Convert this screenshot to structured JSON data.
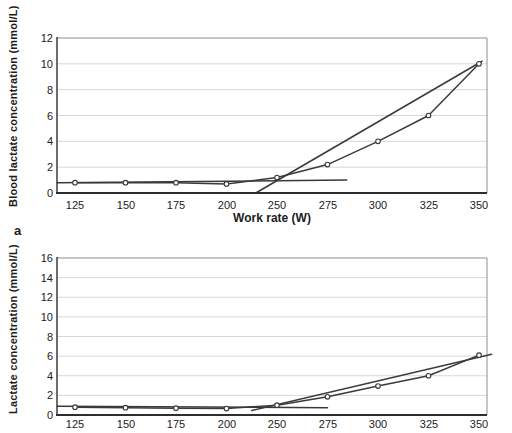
{
  "figure": {
    "panel_label": "a"
  },
  "colors": {
    "line": "#3a3a3a",
    "grid": "#d6d6d6",
    "border": "#8f8f8f",
    "axis": "#2e2e2e",
    "text": "#1c1c1c",
    "marker_fill": "#ffffff",
    "background": "#ffffff"
  },
  "chart_data": [
    {
      "type": "line",
      "title": "",
      "xlabel": "Work rate (W)",
      "ylabel": "Blood lactate concentration (mmol/L)",
      "categories": [
        "125",
        "150",
        "175",
        "200",
        "250",
        "275",
        "300",
        "325",
        "350"
      ],
      "ylim": [
        0,
        12
      ],
      "yticks": [
        0,
        2,
        4,
        6,
        8,
        10,
        12
      ],
      "grid": true,
      "legend": "none",
      "series": [
        {
          "name": "blood lactate",
          "marker": "open-circle",
          "values": [
            0.8,
            0.8,
            0.8,
            0.7,
            1.2,
            2.2,
            4.0,
            6.0,
            10.0
          ]
        }
      ],
      "fit_lines": [
        {
          "name": "baseline-fit-line",
          "x1": -0.35,
          "y1": 0.8,
          "x2": 5.38,
          "y2": 1.0
        },
        {
          "name": "threshold-fit-line",
          "x1": 3.58,
          "y1": 0.0,
          "x2": 8.06,
          "y2": 10.2
        }
      ]
    },
    {
      "type": "line",
      "title": "",
      "xlabel": "",
      "ylabel": "Lactate concentration (mmol/L)",
      "categories": [
        "125",
        "150",
        "175",
        "200",
        "250",
        "275",
        "300",
        "325",
        "350"
      ],
      "ylim": [
        0,
        16
      ],
      "yticks": [
        0,
        2,
        4,
        6,
        8,
        10,
        12,
        14,
        16
      ],
      "grid": true,
      "legend": "none",
      "series": [
        {
          "name": "lactate",
          "marker": "open-circle",
          "values": [
            0.8,
            0.75,
            0.7,
            0.65,
            1.0,
            1.85,
            2.95,
            4.0,
            6.1
          ]
        }
      ],
      "fit_lines": [
        {
          "name": "baseline-fit-line",
          "x1": -0.35,
          "y1": 0.9,
          "x2": 5.0,
          "y2": 0.75
        },
        {
          "name": "threshold-fit-line",
          "x1": 3.5,
          "y1": 0.45,
          "x2": 8.25,
          "y2": 6.2
        }
      ]
    }
  ]
}
